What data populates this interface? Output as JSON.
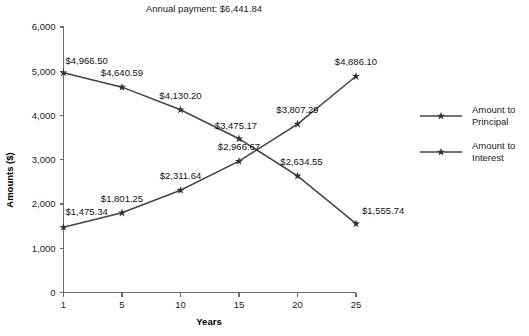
{
  "chart_data": {
    "type": "line",
    "title": "Annual payment: $6,441.84",
    "xlabel": "Years",
    "ylabel": "Amounts ($)",
    "categories": [
      "1",
      "5",
      "10",
      "15",
      "20",
      "25"
    ],
    "x": [
      1,
      5,
      10,
      15,
      20,
      25
    ],
    "ylim": [
      0,
      6000
    ],
    "ytick_labels": [
      "0",
      "1,000",
      "2,000",
      "3,000",
      "4,000",
      "5,000",
      "6,000"
    ],
    "ytick_values": [
      0,
      1000,
      2000,
      3000,
      4000,
      5000,
      6000
    ],
    "grid": false,
    "legend_position": "right",
    "series": [
      {
        "name": "Amount to Principal",
        "values": [
          1475.34,
          1801.25,
          2311.64,
          2966.67,
          3807.29,
          4886.1
        ],
        "labels": [
          "$1,475.34",
          "$1,801.25",
          "$2,311.64",
          "$2,966.67",
          "$3,807.29",
          "$4,886.10"
        ],
        "color": "#444444"
      },
      {
        "name": "Amount to Interest",
        "values": [
          4966.5,
          4640.59,
          4130.2,
          3475.17,
          2634.55,
          1555.74
        ],
        "labels": [
          "$4,966.50",
          "$4,640.59",
          "$4,130.20",
          "$3,475.17",
          "$2,634.55",
          "$1,555.74"
        ],
        "color": "#444444"
      }
    ]
  },
  "legend": {
    "items": [
      {
        "line1": "Amount to",
        "line2": "Principal"
      },
      {
        "line1": "Amount to",
        "line2": "Interest"
      }
    ]
  },
  "colors": {
    "line": "#444444",
    "axis": "#6b6b6b",
    "text": "#1a1a1a",
    "background": "#ffffff"
  }
}
